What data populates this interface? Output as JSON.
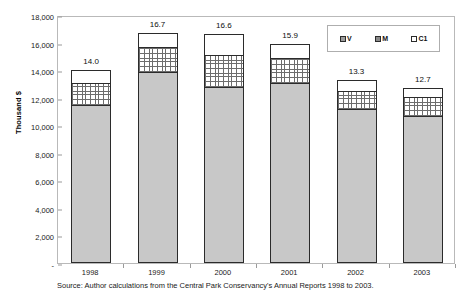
{
  "chart_data": {
    "type": "bar",
    "title": "",
    "subtype": "stacked-column",
    "categories": [
      "1998",
      "1999",
      "2000",
      "2001",
      "2002",
      "2003"
    ],
    "series": [
      {
        "name": "V",
        "values": [
          11500,
          13850,
          12800,
          13050,
          11150,
          10650
        ]
      },
      {
        "name": "M",
        "values": [
          1600,
          1850,
          2300,
          1850,
          1350,
          1400
        ]
      },
      {
        "name": "C1",
        "values": [
          900,
          1000,
          1500,
          1000,
          800,
          650
        ]
      }
    ],
    "totals": [
      14000,
      16700,
      16600,
      15900,
      13300,
      12700
    ],
    "data_labels": [
      "14.0",
      "16.7",
      "16.6",
      "15.9",
      "13.3",
      "12.7"
    ],
    "xlabel": "",
    "ylabel": "Thousand $",
    "ylim": [
      0,
      18000
    ],
    "ytick_labels": [
      "18,000",
      "16,000",
      "14,000",
      "12,000",
      "10,000",
      "8,000",
      "6,000",
      "4,000",
      "2,000",
      "-"
    ],
    "ytick_values": [
      18000,
      16000,
      14000,
      12000,
      10000,
      8000,
      6000,
      4000,
      2000,
      0
    ],
    "grid": false,
    "legend_position": "inside-top-right",
    "legend": [
      {
        "label": "V",
        "swatch": "legend-swatch-v"
      },
      {
        "label": "M",
        "swatch": "legend-swatch-m"
      },
      {
        "label": "C1",
        "swatch": "legend-swatch-c1"
      }
    ],
    "source_note": "Source: Author calculations from the Central Park Conservancy's Annual Reports 1998 to 2003.",
    "colors": {
      "series_v": "#c8c8c8",
      "series_m": "#ffffff",
      "series_c1": "#ffffff",
      "outline": "#2b2b2b",
      "frame": "#b9b9b9",
      "text": "#1a1a1a"
    }
  }
}
